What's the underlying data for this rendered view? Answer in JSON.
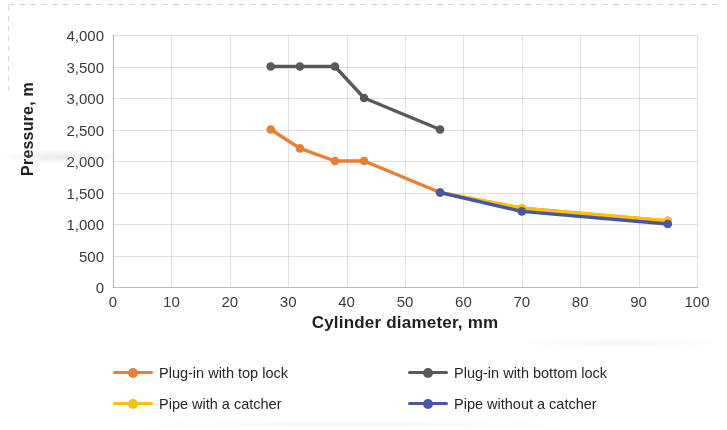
{
  "chart_data": {
    "type": "line",
    "title": "",
    "xlabel": "Cylinder diameter, mm",
    "ylabel": "Pressure, m",
    "xlim": [
      0,
      100
    ],
    "ylim": [
      0,
      4000
    ],
    "xticks": [
      "0",
      "10",
      "20",
      "30",
      "40",
      "50",
      "60",
      "70",
      "80",
      "90",
      "100"
    ],
    "yticks": [
      "0",
      "500",
      "1,000",
      "1,500",
      "2,000",
      "2,500",
      "3,000",
      "3,500",
      "4,000"
    ],
    "grid": "both-faint",
    "legend_position": "bottom",
    "series": [
      {
        "name": "Plug-in with top lock",
        "color": "#ED7D31",
        "x": [
          27,
          32,
          38,
          43,
          56,
          70,
          95
        ],
        "values": [
          2500,
          2200,
          2000,
          2000,
          1500,
          1250,
          1050
        ]
      },
      {
        "name": "Plug-in with bottom lock",
        "color": "#595959",
        "x": [
          27,
          32,
          38,
          43,
          56
        ],
        "values": [
          3500,
          3500,
          3500,
          3000,
          2500
        ]
      },
      {
        "name": "Pipe with a catcher",
        "color": "#FFC000",
        "x": [
          56,
          70,
          95
        ],
        "values": [
          1500,
          1250,
          1050
        ]
      },
      {
        "name": "Pipe without a catcher",
        "color": "#4456A6",
        "x": [
          56,
          70,
          95
        ],
        "values": [
          1500,
          1200,
          1000
        ]
      }
    ]
  },
  "axes": {
    "y_title": "Pressure, m",
    "x_title": "Cylinder diameter, mm"
  },
  "legend": {
    "items": [
      {
        "label": "Plug-in with top lock",
        "color": "#ED7D31"
      },
      {
        "label": "Plug-in with bottom lock",
        "color": "#595959"
      },
      {
        "label": "Pipe with a catcher",
        "color": "#FFC000"
      },
      {
        "label": "Pipe without a catcher",
        "color": "#4456A6"
      }
    ]
  }
}
